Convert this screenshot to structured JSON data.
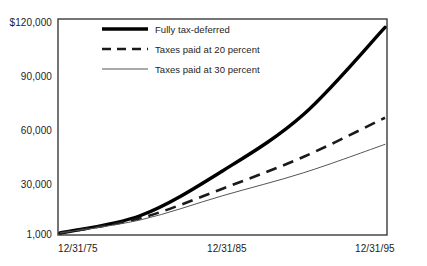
{
  "chart_data": {
    "type": "line",
    "title": "",
    "subtitle": "",
    "xlabel": "",
    "ylabel": "",
    "x": [
      "12/31/75",
      "12/31/85",
      "12/31/95"
    ],
    "xtick_labels": [
      "12/31/75",
      "12/31/85",
      "12/31/95"
    ],
    "ytick_labels": [
      "$120,000",
      "90,000",
      "60,000",
      "30,000",
      "1,000"
    ],
    "ytick_values": [
      120000,
      90000,
      60000,
      30000,
      1000
    ],
    "ylim": [
      1000,
      120000
    ],
    "grid": false,
    "legend_position": "top-left-inside",
    "series": [
      {
        "name": "Fully tax-deferred",
        "style": "solid-thick",
        "color": "#000000",
        "x": [
          "12/31/75",
          "12/31/80",
          "12/31/85",
          "12/31/90",
          "12/31/95"
        ],
        "values": [
          1000,
          11000,
          36000,
          68000,
          117000
        ]
      },
      {
        "name": "Taxes paid at 20 percent",
        "style": "dashed",
        "color": "#1a1a1a",
        "x": [
          "12/31/75",
          "12/31/80",
          "12/31/85",
          "12/31/90",
          "12/31/95"
        ],
        "values": [
          1000,
          9500,
          26000,
          44000,
          66000
        ]
      },
      {
        "name": "Taxes paid at 30 percent",
        "style": "solid-thin",
        "color": "#555555",
        "x": [
          "12/31/75",
          "12/31/80",
          "12/31/85",
          "12/31/90",
          "12/31/95"
        ],
        "values": [
          1000,
          8500,
          22000,
          35000,
          51000
        ]
      }
    ]
  },
  "axis": {
    "y": {
      "t120000": "$120,000",
      "t90000": "90,000",
      "t60000": "60,000",
      "t30000": "30,000",
      "t1000": "1,000"
    },
    "x": {
      "t1": "12/31/75",
      "t2": "12/31/85",
      "t3": "12/31/95"
    }
  },
  "legend": {
    "item1": "Fully tax-deferred",
    "item2": "Taxes paid at 20 percent",
    "item3": "Taxes paid at 30 percent"
  }
}
